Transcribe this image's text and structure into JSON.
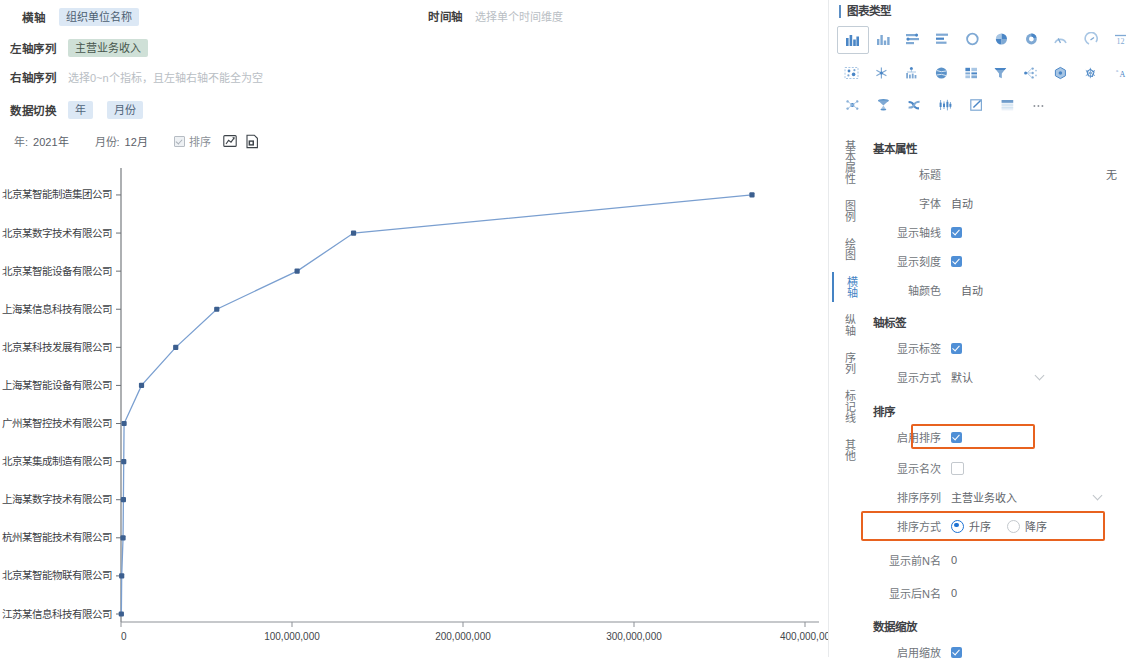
{
  "query_bar": {
    "x_axis": {
      "label": "横轴",
      "value": "组织单位名称"
    },
    "time_axis": {
      "label": "时间轴",
      "placeholder": "选择单个时间维度"
    },
    "left_series": {
      "label": "左轴序列",
      "value": "主营业务收入"
    },
    "right_series": {
      "label": "右轴序列",
      "placeholder": "选择0~n个指标，且左轴右轴不能全为空"
    },
    "data_switch": {
      "label": "数据切换",
      "options": [
        "年",
        "月份"
      ]
    }
  },
  "toolbar": {
    "year_label": "年:",
    "year_value": "2021年",
    "month_label": "月份:",
    "month_value": "12月",
    "sort_checkbox_label": "排序",
    "edit_icon": "edit-chart-icon",
    "export_icon": "export-doc-icon"
  },
  "right_panel": {
    "chart_type_title": "图表类型",
    "chart_type_icons": [
      [
        "bar-chart-icon",
        "column-chart-icon",
        "stacked-bar-icon",
        "horizontal-bar-icon",
        "ring-icon",
        "pie-icon",
        "donut-icon",
        "gauge-icon",
        "semicircle-gauge-icon",
        "number-12-icon"
      ],
      [
        "scatter-map-icon",
        "snowflake-icon",
        "bar-tree-icon",
        "globe-icon",
        "matrix-icon",
        "funnel-icon",
        "tree-node-icon",
        "polygon-icon",
        "radar-icon",
        "word-cloud-icon"
      ],
      [
        "network-icon",
        "3d-funnel-icon",
        "sankey-icon",
        "candlestick-icon",
        "edit-square-icon",
        "table-icon",
        "more-icon"
      ]
    ],
    "tabs": [
      {
        "label": "基本属性",
        "active": false
      },
      {
        "label": "图例",
        "active": false
      },
      {
        "label": "绘图",
        "active": false
      },
      {
        "label": "横轴",
        "active": true
      },
      {
        "label": "纵轴",
        "active": false
      },
      {
        "label": "序列",
        "active": false
      },
      {
        "label": "标记线",
        "active": false
      },
      {
        "label": "其他",
        "active": false
      }
    ],
    "basic": {
      "heading": "基本属性",
      "title_label": "标题",
      "title_value": "无",
      "font_label": "字体",
      "font_value": "自动",
      "show_axisline_label": "显示轴线",
      "show_tick_label": "显示刻度",
      "axis_color_label": "轴颜色",
      "axis_color_value": "自动"
    },
    "axis_label": {
      "heading": "轴标签",
      "show_label": "显示标签",
      "display_mode_label": "显示方式",
      "display_mode_value": "默认"
    },
    "sort": {
      "heading": "排序",
      "enable_label": "启用排序",
      "show_rank_label": "显示名次",
      "sort_series_label": "排序序列",
      "sort_series_value": "主营业务收入",
      "sort_mode_label": "排序方式",
      "sort_mode_asc": "升序",
      "sort_mode_desc": "降序",
      "top_n_label": "显示前N名",
      "top_n_value": "0",
      "bottom_n_label": "显示后N名",
      "bottom_n_value": "0"
    },
    "zoom": {
      "heading": "数据缩放",
      "enable_label": "启用缩放"
    },
    "highlight_color": "#e8621f",
    "accent_color": "#4f8fd6"
  },
  "chart_data": {
    "type": "line",
    "title": "",
    "xlabel": "",
    "ylabel": "",
    "orientation": "horizontal",
    "series_name": "主营业务收入",
    "line_color": "#7a9fd0",
    "marker_color": "#3c5f8f",
    "xlim": [
      0,
      400000000
    ],
    "xticks": [
      0,
      100000000,
      200000000,
      300000000,
      400000000
    ],
    "xtick_labels": [
      "0",
      "100,000,000",
      "200,000,000",
      "300,000,000",
      "400,000,00"
    ],
    "grid": false,
    "categories": [
      "江苏某信息科技有限公司",
      "北京某智能物联有限公司",
      "杭州某智能技术有限公司",
      "上海某数字技术有限公司",
      "北京某集成制造有限公司",
      "广州某智控技术有限公司",
      "上海某智能设备有限公司",
      "北京某科技发展有限公司",
      "上海某信息科技有限公司",
      "北京某智能设备有限公司",
      "北京某数字技术有限公司",
      "北京某智能制造集团公司"
    ],
    "values": [
      200000,
      400000,
      1200000,
      1400000,
      1600000,
      1800000,
      12000000,
      32000000,
      56000000,
      103000000,
      136000000,
      369000000
    ]
  }
}
